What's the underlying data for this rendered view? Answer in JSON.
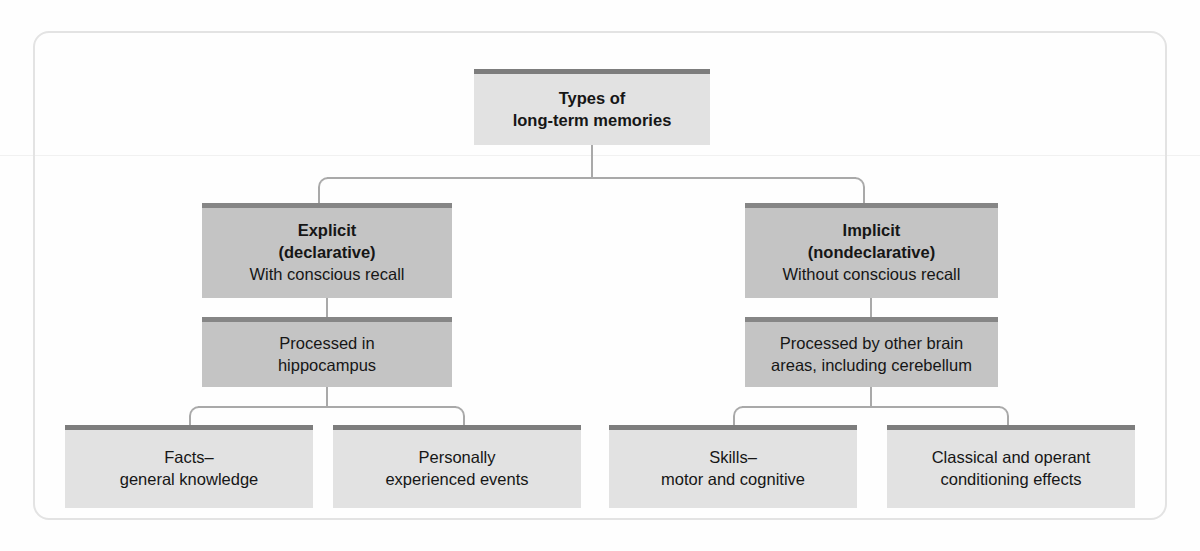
{
  "figure": {
    "type": "hierarchy-flowchart",
    "title_node": "types-of-long-term-memories",
    "root": {
      "line1": "Types of",
      "line2": "long-term memories"
    },
    "branches": [
      {
        "id": "explicit",
        "title": "Explicit",
        "subtitle": "(declarative)",
        "description": "With conscious recall",
        "processing": {
          "line1": "Processed in",
          "line2": "hippocampus"
        },
        "children": [
          {
            "id": "facts",
            "line1": "Facts–",
            "line2": "general knowledge"
          },
          {
            "id": "events",
            "line1": "Personally",
            "line2": "experienced events"
          }
        ]
      },
      {
        "id": "implicit",
        "title": "Implicit",
        "subtitle": "(nondeclarative)",
        "description": "Without conscious recall",
        "processing": {
          "line1": "Processed by other brain",
          "line2": "areas, including cerebellum"
        },
        "children": [
          {
            "id": "skills",
            "line1": "Skills–",
            "line2": "motor and cognitive"
          },
          {
            "id": "conditioning",
            "line1": "Classical and operant",
            "line2": "conditioning effects"
          }
        ]
      }
    ]
  },
  "colors": {
    "page_background": "#fefefe",
    "frame_border": "#e3e3e3",
    "node_fill_light": "#e2e2e2",
    "node_fill_dark": "#c4c4c4",
    "node_top_bar_light": "#7d7d7d",
    "node_top_bar_dark": "#868686",
    "connector": "#a9a9a9",
    "text": "#161616"
  }
}
